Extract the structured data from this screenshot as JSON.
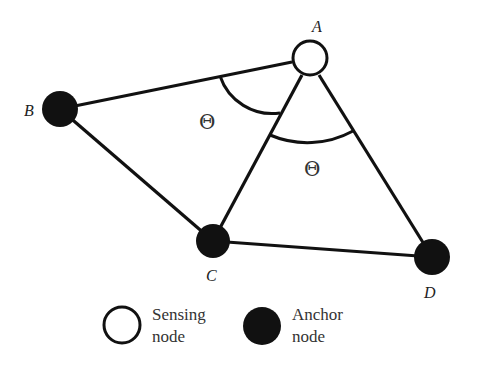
{
  "diagram": {
    "nodes": [
      {
        "id": "A",
        "label": "A",
        "type": "sensing",
        "x": 310,
        "y": 58,
        "r": 18,
        "lx": 318,
        "ly": 31
      },
      {
        "id": "B",
        "label": "B",
        "type": "anchor",
        "x": 60,
        "y": 109,
        "r": 18,
        "lx": 30,
        "ly": 115
      },
      {
        "id": "C",
        "label": "C",
        "type": "anchor",
        "x": 213,
        "y": 241,
        "r": 17,
        "lx": 213,
        "ly": 281
      },
      {
        "id": "D",
        "label": "D",
        "type": "anchor",
        "x": 432,
        "y": 257,
        "r": 18,
        "lx": 432,
        "ly": 298
      }
    ],
    "edges": [
      [
        "A",
        "B"
      ],
      [
        "B",
        "C"
      ],
      [
        "A",
        "C"
      ],
      [
        "A",
        "D"
      ],
      [
        "C",
        "D"
      ]
    ],
    "angles": [
      {
        "symbol": "Θ",
        "between": [
          "AB",
          "AC"
        ],
        "x": 209,
        "y": 128
      },
      {
        "symbol": "Θ",
        "between": [
          "AC",
          "AD"
        ],
        "x": 314,
        "y": 175
      }
    ]
  },
  "legend": {
    "sensing": {
      "line1": "Sensing",
      "line2": "node"
    },
    "anchor": {
      "line1": "Anchor",
      "line2": "node"
    }
  },
  "colors": {
    "stroke": "#111111",
    "anchor_fill": "#111111",
    "sensing_fill": "#ffffff"
  }
}
